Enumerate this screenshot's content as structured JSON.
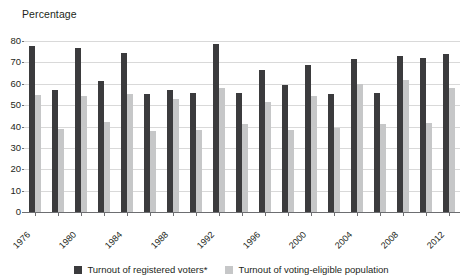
{
  "chart_data": {
    "type": "bar",
    "title": "",
    "ylabel": "Percentage",
    "xlabel": "",
    "ylim": [
      0,
      80
    ],
    "yticks": [
      0,
      10,
      20,
      30,
      40,
      50,
      60,
      70,
      80
    ],
    "grid": true,
    "legend_position": "bottom",
    "categories": [
      "1976",
      "1978",
      "1980",
      "1982",
      "1984",
      "1986",
      "1988",
      "1990",
      "1992",
      "1994",
      "1996",
      "1998",
      "2000",
      "2002",
      "2004",
      "2006",
      "2008",
      "2010",
      "2012"
    ],
    "tick_labels": [
      "1976",
      "1980",
      "1984",
      "1988",
      "1992",
      "1996",
      "2000",
      "2004",
      "2008",
      "2012"
    ],
    "series": [
      {
        "name": "Turnout of registered voters*",
        "color": "#3b3b3d",
        "values": [
          77.5,
          56.9,
          76.5,
          61.3,
          74.6,
          55.4,
          57.0,
          55.8,
          78.8,
          55.7,
          66.6,
          59.3,
          68.8,
          55.3,
          71.5,
          55.5,
          73.2,
          72.0,
          74.0
        ]
      },
      {
        "name": "Turnout of voting-eligible population",
        "color": "#c6c7c8",
        "values": [
          54.8,
          39.0,
          54.2,
          42.1,
          55.2,
          38.1,
          52.8,
          38.4,
          58.1,
          41.1,
          51.7,
          38.6,
          54.2,
          39.5,
          60.1,
          41.3,
          61.6,
          41.8,
          58.2
        ]
      }
    ]
  },
  "legend": {
    "items": [
      {
        "label": "Turnout of registered voters*",
        "swatch": "dark-swatch"
      },
      {
        "label": "Turnout of voting-eligible population",
        "swatch": "light-swatch"
      }
    ]
  },
  "axes": {
    "y_title": "Percentage"
  }
}
